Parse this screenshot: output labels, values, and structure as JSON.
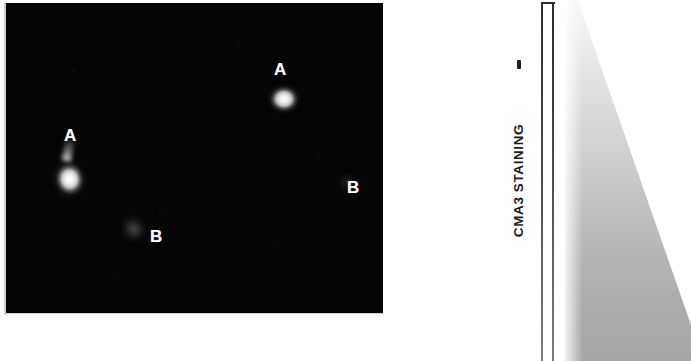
{
  "figure": {
    "micrograph": {
      "description": "dark-field fluorescence micrograph",
      "background_color": "#050505",
      "markers": [
        {
          "label": "A",
          "meaning": "brightly CMA3-stained cell",
          "x": 65,
          "y": 133
        },
        {
          "label": "A",
          "meaning": "brightly CMA3-stained cell",
          "x": 275,
          "y": 67
        },
        {
          "label": "B",
          "meaning": "weakly CMA3-stained cell",
          "x": 150,
          "y": 234
        },
        {
          "label": "B",
          "meaning": "weakly CMA3-stained cell",
          "x": 347,
          "y": 185
        }
      ]
    },
    "scale": {
      "axis_label": "CMA3 STAINING",
      "minus_tick": "–",
      "wedge": {
        "meaning": "intensity gradient wedge, light at top to grey at bottom",
        "top_color": "#f7f7f7",
        "bottom_color": "#a6a6a6"
      },
      "rule_color": "#2b2b2b"
    }
  }
}
